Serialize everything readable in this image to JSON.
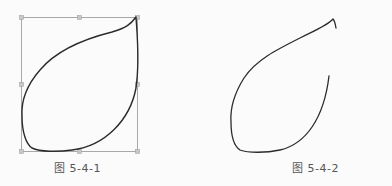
{
  "figures": [
    {
      "caption": "图 5-4-1",
      "selected": true,
      "shape": "closed-leaf-path",
      "bounding_box": {
        "x": 21,
        "y": 17,
        "width": 116,
        "height": 134
      }
    },
    {
      "caption": "图 5-4-2",
      "selected": false,
      "shape": "open-leaf-path"
    }
  ],
  "colors": {
    "stroke": "#2b2b2b",
    "selection_box": "#a8a8a8",
    "handle": "#b0b0b0",
    "background": "#fbfbfb"
  }
}
